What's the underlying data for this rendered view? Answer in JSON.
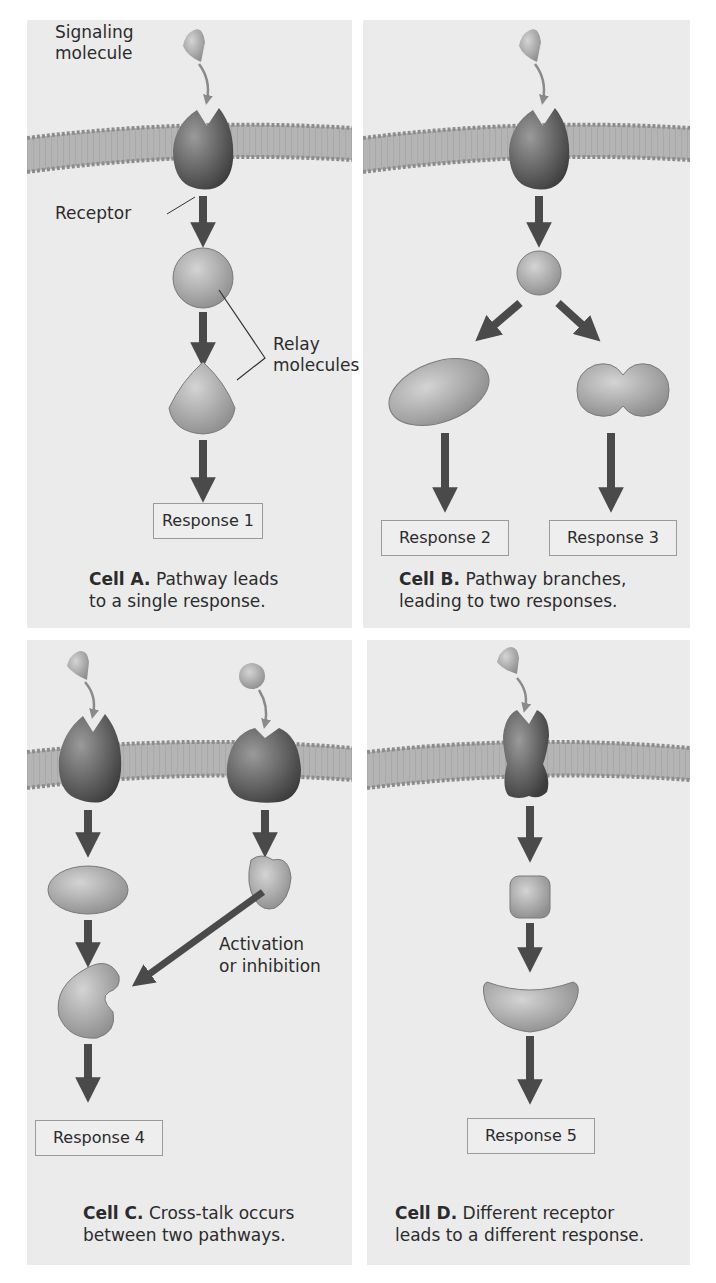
{
  "colors": {
    "panel_bg": "#ebebeb",
    "membrane": "#a9a9a9",
    "receptor": "#555555",
    "molecule": "#9c9c9c",
    "arrow": "#4a4a4a",
    "signal_arrow": "#8a8a8a"
  },
  "cell_a": {
    "labels": {
      "signaling_molecule_1": "Signaling",
      "signaling_molecule_2": "molecule",
      "receptor": "Receptor",
      "relay_1": "Relay",
      "relay_2": "molecules"
    },
    "response": "Response 1",
    "caption_bold": "Cell A.",
    "caption_line1": " Pathway leads",
    "caption_line2": "to a single response."
  },
  "cell_b": {
    "response_left": "Response 2",
    "response_right": "Response 3",
    "caption_bold": "Cell B.",
    "caption_line1": " Pathway branches,",
    "caption_line2": "leading to two responses."
  },
  "cell_c": {
    "labels": {
      "activation_1": "Activation",
      "activation_2": "or inhibition"
    },
    "response": "Response 4",
    "caption_bold": "Cell C.",
    "caption_line1": " Cross-talk occurs",
    "caption_line2": "between two pathways."
  },
  "cell_d": {
    "response": "Response 5",
    "caption_bold": "Cell D.",
    "caption_line1": " Different receptor",
    "caption_line2": "leads to a different response."
  }
}
